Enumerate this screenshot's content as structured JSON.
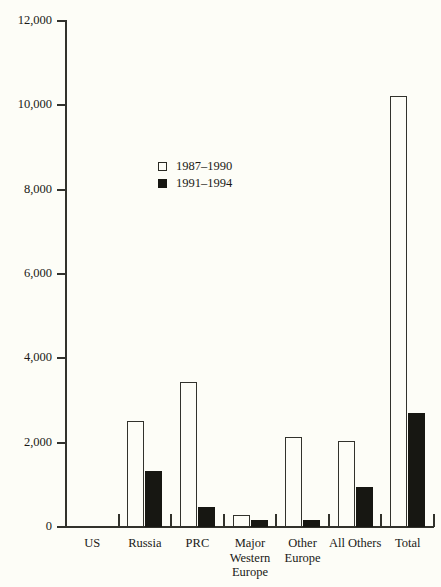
{
  "chart_data": {
    "type": "bar",
    "title": "",
    "subtitle": "",
    "xlabel": "",
    "ylabel": "",
    "ylim": [
      0,
      12000
    ],
    "ytick_values": [
      0,
      2000,
      4000,
      6000,
      8000,
      10000,
      12000
    ],
    "ytick_labels": [
      "0",
      "2,000",
      "4,000",
      "6,000",
      "8,000",
      "10,000",
      "12,000"
    ],
    "grid": false,
    "legend_position": "inside-upper-left",
    "categories": [
      "US",
      "Russia",
      "PRC",
      "Major Western Europe",
      "Other Europe",
      "All Others",
      "Total"
    ],
    "category_label_lines": [
      [
        "US"
      ],
      [
        "Russia"
      ],
      [
        "PRC"
      ],
      [
        "Major",
        "Western",
        "Europe"
      ],
      [
        "Other",
        "Europe"
      ],
      [
        "All Others"
      ],
      [
        "Total"
      ]
    ],
    "series": [
      {
        "name": "1987-1990",
        "style": "open",
        "color": "#fdfdf7",
        "edge_color": "#32322c",
        "values": [
          0,
          2520,
          3430,
          280,
          2130,
          2030,
          10230
        ]
      },
      {
        "name": "1991-1994",
        "style": "filled",
        "color": "#171712",
        "edge_color": "#171712",
        "values": [
          0,
          1330,
          470,
          170,
          160,
          950,
          2710
        ]
      }
    ]
  },
  "legend": {
    "entries": [
      {
        "label": "1987–1990",
        "style": "open"
      },
      {
        "label": "1991–1994",
        "style": "filled"
      }
    ]
  },
  "axes": {
    "y": {
      "labels": [
        "12,000",
        "10,000",
        "8,000",
        "6,000",
        "4,000",
        "2,000",
        "0"
      ]
    }
  },
  "colors": {
    "background": "#fdfdf7",
    "axis": "#32322c",
    "text": "#1a1a16",
    "series_open": "#fdfdf7",
    "series_filled": "#171712"
  }
}
